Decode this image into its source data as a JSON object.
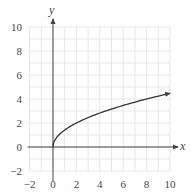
{
  "chart_data": {
    "type": "line",
    "title": "",
    "xlabel": "x",
    "ylabel": "y",
    "xlim": [
      -2,
      10
    ],
    "ylim": [
      -2,
      10
    ],
    "grid": true,
    "grid_step": 1,
    "x_ticks": [
      -2,
      0,
      2,
      4,
      6,
      8,
      10
    ],
    "y_ticks": [
      -2,
      0,
      2,
      4,
      6,
      8,
      10
    ],
    "x_tick_labels": [
      "−2",
      "0",
      "2",
      "4",
      "6",
      "8",
      "10"
    ],
    "y_tick_labels": [
      "−2",
      "0",
      "2",
      "4",
      "6",
      "8",
      "10"
    ],
    "series": [
      {
        "name": "y = sqrt(2x)",
        "x": [
          0,
          0.25,
          0.5,
          1,
          2,
          3,
          4,
          5,
          6,
          7,
          8,
          9,
          10
        ],
        "y": [
          0,
          0.71,
          1.0,
          1.41,
          2.0,
          2.45,
          2.83,
          3.16,
          3.46,
          3.74,
          4.0,
          4.24,
          4.47
        ],
        "color": "#333333",
        "end_arrow": true
      }
    ],
    "legend": null
  },
  "colors": {
    "grid": "#e6e6e6",
    "axis": "#444444",
    "curve": "#333333"
  }
}
